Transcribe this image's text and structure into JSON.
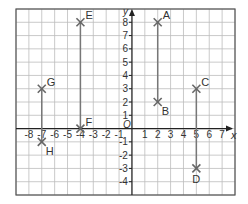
{
  "diagram": {
    "type": "coordinate-grid",
    "x_axis": {
      "label": "x",
      "min": -9,
      "max": 8,
      "tick_labels": [
        -8,
        -7,
        -6,
        -5,
        -4,
        -3,
        -2,
        -1,
        1,
        2,
        3,
        4,
        5,
        6,
        7
      ]
    },
    "y_axis": {
      "label": "y",
      "min": -5,
      "max": 9,
      "tick_labels": [
        8,
        7,
        6,
        5,
        4,
        3,
        2,
        1,
        -1,
        -2,
        -3,
        -4
      ]
    },
    "origin_label": "O",
    "points": [
      {
        "name": "A",
        "x": 2,
        "y": 8
      },
      {
        "name": "B",
        "x": 2,
        "y": 2
      },
      {
        "name": "C",
        "x": 5,
        "y": 3
      },
      {
        "name": "D",
        "x": 5,
        "y": -3
      },
      {
        "name": "E",
        "x": -4,
        "y": 8
      },
      {
        "name": "F",
        "x": -4,
        "y": 0
      },
      {
        "name": "G",
        "x": -7,
        "y": 3
      },
      {
        "name": "H",
        "x": -7,
        "y": -1
      }
    ],
    "segments": [
      [
        "A",
        "B"
      ],
      [
        "C",
        "D"
      ],
      [
        "E",
        "F"
      ],
      [
        "G",
        "H"
      ]
    ],
    "colors": {
      "grid": "#bdbdbd",
      "axis": "#222222",
      "border": "#555555",
      "segment": "#777777",
      "marker": "#666666"
    }
  }
}
